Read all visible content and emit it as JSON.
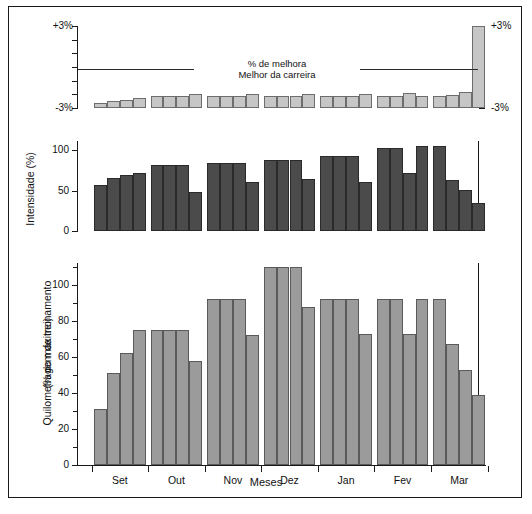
{
  "figure": {
    "caption": "Figura 10-4. Exemplo",
    "xlabel": "Meses",
    "months": [
      "Set",
      "Out",
      "Nov",
      "Dez",
      "Jan",
      "Fev",
      "Mar"
    ],
    "weeks_per_month": 4
  },
  "panel_top": {
    "title_line1": "% de melhora",
    "title_line2": "Melhor da carreira",
    "ytick_top": "+3%",
    "ytick_bottom": "-3%",
    "ytick_top_right": "+3%",
    "ytick_bottom_right": "-3%"
  },
  "panel_middle": {
    "ylabel": "Intensidade (%)",
    "yticks": [
      "0",
      "50",
      "100"
    ]
  },
  "panel_bottom": {
    "ylabel_line1": "Quilometragem de treinamento",
    "ylabel_line2": "(% do máximo)",
    "yticks": [
      "0",
      "20",
      "40",
      "60",
      "80",
      "100"
    ]
  },
  "colors": {
    "panel_top_bar": "#c6c6c6",
    "panel_middle_bar": "#4b4b4b",
    "panel_bottom_bar": "#9b9b9b",
    "axis": "#1a1a1a",
    "frame": "#1a1a1a"
  },
  "chart_data": [
    {
      "type": "bar",
      "title": "% de melhora / Melhor da carreira",
      "xlabel": "Meses",
      "ylabel": "% de melhora",
      "ylim": [
        -3,
        3
      ],
      "grid": false,
      "legend": "none",
      "annotations": [
        "% de melhora",
        "Melhor da carreira"
      ],
      "categories": [
        "Set-1",
        "Set-2",
        "Set-3",
        "Set-4",
        "Out-1",
        "Out-2",
        "Out-3",
        "Out-4",
        "Nov-1",
        "Nov-2",
        "Nov-3",
        "Nov-4",
        "Dez-1",
        "Dez-2",
        "Dez-3",
        "Dez-4",
        "Jan-1",
        "Jan-2",
        "Jan-3",
        "Jan-4",
        "Fev-1",
        "Fev-2",
        "Fev-3",
        "Fev-4",
        "Mar-1",
        "Mar-2",
        "Mar-3",
        "Mar-4"
      ],
      "values": [
        -2.6,
        -2.5,
        -2.45,
        -2.3,
        -2.15,
        -2.15,
        -2.15,
        -2.0,
        -2.15,
        -2.15,
        -2.1,
        -1.95,
        -2.15,
        -2.15,
        -2.15,
        -2.0,
        -2.15,
        -2.15,
        -2.1,
        -1.95,
        -2.15,
        -2.15,
        -1.9,
        -2.15,
        -2.15,
        -2.05,
        -1.8,
        3.0
      ]
    },
    {
      "type": "bar",
      "title": "Intensidade",
      "xlabel": "Meses",
      "ylabel": "Intensidade (%)",
      "ylim": [
        0,
        110
      ],
      "yticks": [
        0,
        50,
        100
      ],
      "grid": false,
      "legend": "none",
      "categories": [
        "Set-1",
        "Set-2",
        "Set-3",
        "Set-4",
        "Out-1",
        "Out-2",
        "Out-3",
        "Out-4",
        "Nov-1",
        "Nov-2",
        "Nov-3",
        "Nov-4",
        "Dez-1",
        "Dez-2",
        "Dez-3",
        "Dez-4",
        "Jan-1",
        "Jan-2",
        "Jan-3",
        "Jan-4",
        "Fev-1",
        "Fev-2",
        "Fev-3",
        "Fev-4",
        "Mar-1",
        "Mar-2",
        "Mar-3",
        "Mar-4"
      ],
      "values": [
        57,
        66,
        69,
        72,
        82,
        82,
        82,
        48,
        84,
        84,
        84,
        60,
        88,
        88,
        88,
        64,
        93,
        93,
        93,
        61,
        102,
        102,
        72,
        105,
        105,
        63,
        51,
        34
      ]
    },
    {
      "type": "bar",
      "title": "Quilometragem de treinamento",
      "xlabel": "Meses",
      "ylabel": "Quilometragem de treinamento (% do máximo)",
      "ylim": [
        0,
        115
      ],
      "yticks": [
        0,
        20,
        40,
        60,
        80,
        100
      ],
      "grid": false,
      "legend": "none",
      "categories": [
        "Set-1",
        "Set-2",
        "Set-3",
        "Set-4",
        "Out-1",
        "Out-2",
        "Out-3",
        "Out-4",
        "Nov-1",
        "Nov-2",
        "Nov-3",
        "Nov-4",
        "Dez-1",
        "Dez-2",
        "Dez-3",
        "Dez-4",
        "Jan-1",
        "Jan-2",
        "Jan-3",
        "Jan-4",
        "Fev-1",
        "Fev-2",
        "Fev-3",
        "Fev-4",
        "Mar-1",
        "Mar-2",
        "Mar-3",
        "Mar-4"
      ],
      "values": [
        31,
        51,
        62,
        75,
        75,
        75,
        75,
        58,
        92,
        92,
        92,
        72,
        110,
        110,
        110,
        88,
        92,
        92,
        92,
        73,
        92,
        92,
        73,
        92,
        92,
        67,
        53,
        39
      ]
    }
  ]
}
